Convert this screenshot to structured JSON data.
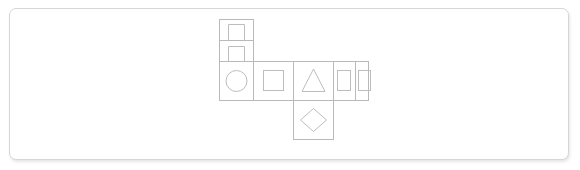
{
  "panel": {
    "background_color": "#ffffff",
    "border_color": "#d6d6d6",
    "corner_radius_px": 7
  },
  "diagram": {
    "name": "cube-net",
    "title": "Cube net",
    "stroke_color": "#b9b9b9",
    "glyph_color": "#bdbdbd",
    "cells": [
      {
        "id": "cell-top-1",
        "position": "column-1-row-1",
        "glyph": "rectangle-open-bottom-icon",
        "glyph_label": "rectangle"
      },
      {
        "id": "cell-top-2",
        "position": "column-1-row-2",
        "glyph": "rectangle-open-bottom-icon",
        "glyph_label": "rectangle"
      },
      {
        "id": "cell-mid-1",
        "position": "column-1-row-3",
        "glyph": "circle-icon",
        "glyph_label": "circle"
      },
      {
        "id": "cell-mid-2",
        "position": "column-2-row-3",
        "glyph": "square-icon",
        "glyph_label": "square"
      },
      {
        "id": "cell-mid-3",
        "position": "column-3-row-3",
        "glyph": "triangle-icon",
        "glyph_label": "triangle"
      },
      {
        "id": "cell-mid-4",
        "position": "column-4-row-3",
        "glyph": "rectangle-icon",
        "glyph_label": "rectangle"
      },
      {
        "id": "cell-mid-5",
        "position": "column-5-row-3",
        "glyph": "rectangle-icon",
        "glyph_label": "rectangle"
      },
      {
        "id": "cell-bottom-1",
        "position": "column-3-row-4",
        "glyph": "diamond-icon",
        "glyph_label": "diamond"
      }
    ]
  }
}
